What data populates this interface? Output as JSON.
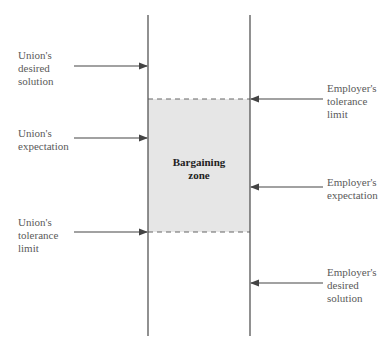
{
  "diagram": {
    "zone": {
      "label": "Bargaining\nzone",
      "fill": "#e6e6e6"
    },
    "union": [
      {
        "id": "union-desired-solution",
        "label": "Union's\ndesired\nsolution",
        "y": 66
      },
      {
        "id": "union-expectation",
        "label": "Union's\nexpectation",
        "y": 138
      },
      {
        "id": "union-tolerance-limit",
        "label": "Union's\ntolerance\nlimit",
        "y": 232
      }
    ],
    "employer": [
      {
        "id": "employer-tolerance-limit",
        "label": "Employer's\ntolerance\nlimit",
        "y": 99
      },
      {
        "id": "employer-expectation",
        "label": "Employer's\nexpectation",
        "y": 187
      },
      {
        "id": "employer-desired-solution",
        "label": "Employer's\ndesired\nsolution",
        "y": 283
      }
    ],
    "colors": {
      "line": "#555555",
      "zone_fill": "#e6e6e6",
      "text": "#5a5a5a"
    }
  }
}
